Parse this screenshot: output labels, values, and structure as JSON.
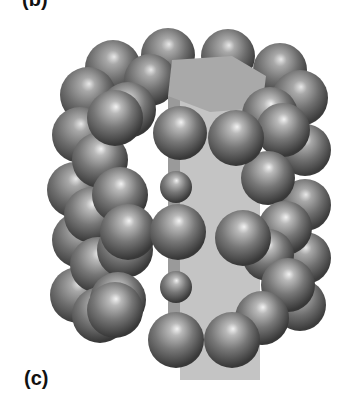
{
  "figure": {
    "top_label": "(b)",
    "panel_label": "(c)",
    "colors": {
      "sphere_light": "#e6e6e6",
      "sphere_mid": "#8a8a8a",
      "sphere_dark": "#3a3a3a",
      "prism_front": "#c4c4c4",
      "prism_top": "#a9a9a9",
      "prism_side": "#9a9a9a"
    },
    "prism": {
      "top": [
        [
          172,
          60
        ],
        [
          232,
          56
        ],
        [
          266,
          76
        ],
        [
          262,
          108
        ],
        [
          210,
          112
        ],
        [
          168,
          96
        ]
      ],
      "front": [
        [
          180,
          96
        ],
        [
          260,
          96
        ],
        [
          260,
          380
        ],
        [
          180,
          380
        ]
      ],
      "side_left": [
        [
          168,
          96
        ],
        [
          180,
          96
        ],
        [
          180,
          330
        ],
        [
          168,
          330
        ]
      ]
    },
    "back_spheres": [
      {
        "cx": 113,
        "cy": 68,
        "r": 28
      },
      {
        "cx": 168,
        "cy": 55,
        "r": 27
      },
      {
        "cx": 228,
        "cy": 56,
        "r": 27
      },
      {
        "cx": 280,
        "cy": 70,
        "r": 27
      },
      {
        "cx": 88,
        "cy": 95,
        "r": 28
      },
      {
        "cx": 150,
        "cy": 80,
        "r": 26
      },
      {
        "cx": 300,
        "cy": 98,
        "r": 28
      },
      {
        "cx": 80,
        "cy": 135,
        "r": 28
      },
      {
        "cx": 75,
        "cy": 190,
        "r": 28
      },
      {
        "cx": 80,
        "cy": 240,
        "r": 28
      },
      {
        "cx": 78,
        "cy": 295,
        "r": 28
      },
      {
        "cx": 305,
        "cy": 150,
        "r": 26
      },
      {
        "cx": 305,
        "cy": 205,
        "r": 26
      },
      {
        "cx": 305,
        "cy": 258,
        "r": 26
      },
      {
        "cx": 300,
        "cy": 305,
        "r": 26
      }
    ],
    "mid_spheres": [
      {
        "cx": 100,
        "cy": 160,
        "r": 28
      },
      {
        "cx": 92,
        "cy": 215,
        "r": 28
      },
      {
        "cx": 98,
        "cy": 265,
        "r": 28
      },
      {
        "cx": 100,
        "cy": 315,
        "r": 28
      },
      {
        "cx": 128,
        "cy": 110,
        "r": 28
      },
      {
        "cx": 120,
        "cy": 195,
        "r": 28
      },
      {
        "cx": 125,
        "cy": 250,
        "r": 28
      },
      {
        "cx": 118,
        "cy": 300,
        "r": 28
      },
      {
        "cx": 270,
        "cy": 115,
        "r": 28
      },
      {
        "cx": 283,
        "cy": 130,
        "r": 27
      },
      {
        "cx": 268,
        "cy": 178,
        "r": 27
      },
      {
        "cx": 285,
        "cy": 228,
        "r": 27
      },
      {
        "cx": 268,
        "cy": 255,
        "r": 26
      },
      {
        "cx": 288,
        "cy": 285,
        "r": 27
      },
      {
        "cx": 262,
        "cy": 318,
        "r": 27
      }
    ],
    "front_spheres": [
      {
        "cx": 115,
        "cy": 118,
        "r": 28
      },
      {
        "cx": 180,
        "cy": 133,
        "r": 27
      },
      {
        "cx": 236,
        "cy": 138,
        "r": 28
      },
      {
        "cx": 176,
        "cy": 187,
        "r": 16
      },
      {
        "cx": 128,
        "cy": 232,
        "r": 28
      },
      {
        "cx": 178,
        "cy": 232,
        "r": 28
      },
      {
        "cx": 243,
        "cy": 238,
        "r": 28
      },
      {
        "cx": 176,
        "cy": 287,
        "r": 16
      },
      {
        "cx": 115,
        "cy": 310,
        "r": 28
      },
      {
        "cx": 176,
        "cy": 340,
        "r": 28
      },
      {
        "cx": 232,
        "cy": 340,
        "r": 28
      }
    ]
  }
}
